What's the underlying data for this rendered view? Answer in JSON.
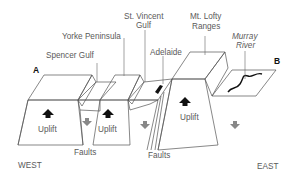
{
  "diagram": {
    "title": "",
    "type": "geological cross-section block diagram",
    "endpoints": {
      "west_marker": "A",
      "east_marker": "B"
    },
    "directions": {
      "west": "WEST",
      "east": "EAST"
    },
    "features": [
      {
        "id": "spencer-gulf",
        "label": "Spencer Gulf"
      },
      {
        "id": "yorke-peninsula",
        "label": "Yorke Peninsula"
      },
      {
        "id": "st-vincent-gulf",
        "label_line1": "St. Vincent",
        "label_line2": "Gulf"
      },
      {
        "id": "adelaide",
        "label": "Adelaide"
      },
      {
        "id": "mt-lofty-ranges",
        "label_line1": "Mt. Lofty",
        "label_line2": "Ranges"
      },
      {
        "id": "murray-river",
        "label_line1": "Murray",
        "label_line2": "River"
      }
    ],
    "blocks": [
      {
        "id": "west-block",
        "movement": "Uplift"
      },
      {
        "id": "yorke-block",
        "movement": "Uplift"
      },
      {
        "id": "lofty-block",
        "movement": "Uplift"
      }
    ],
    "faults": [
      {
        "id": "faults-west",
        "label": "Faults"
      },
      {
        "id": "faults-east",
        "label": "Faults"
      }
    ],
    "colors": {
      "uplift_arrow": "#111111",
      "subsidence_arrow": "#888888",
      "block_top_fill": "#e2e2e2",
      "gulf_water_fill": "#a8a8a8",
      "line": "#555555"
    }
  }
}
